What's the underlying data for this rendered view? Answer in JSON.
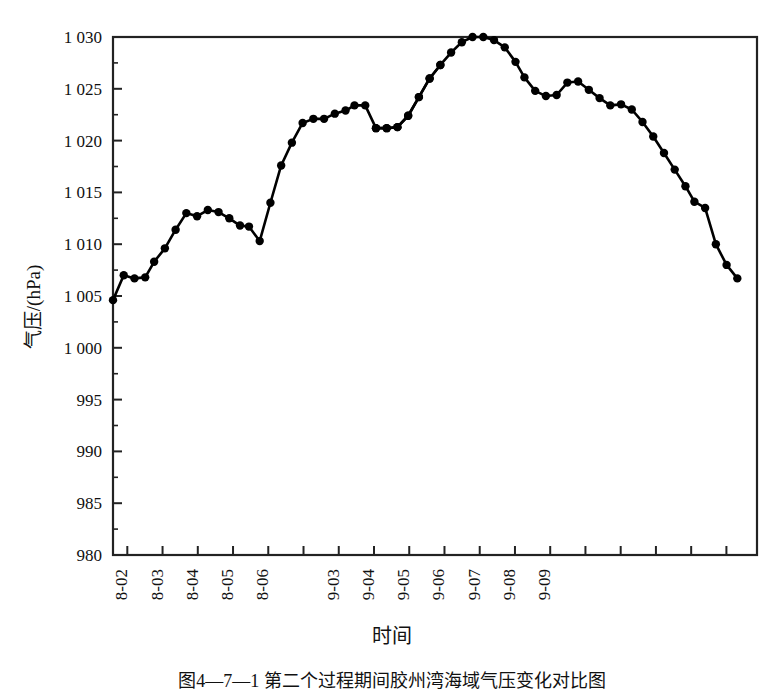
{
  "figure": {
    "y_axis_label": "气压/(hPa)",
    "x_axis_label": "时间",
    "caption": "图4—7—1 第二个过程期间胶州湾海域气压变化对比图"
  },
  "chart_data": {
    "type": "line",
    "title": "",
    "xlabel": "时间",
    "ylabel": "气压/(hPa)",
    "ylim": [
      980,
      1030
    ],
    "ytick_labels": [
      "1 030",
      "1 025",
      "1 020",
      "1 015",
      "1 010",
      "1 005",
      "1 000",
      "995",
      "990",
      "985",
      "980"
    ],
    "ytick_values": [
      1030,
      1025,
      1020,
      1015,
      1010,
      1005,
      1000,
      995,
      990,
      985,
      980
    ],
    "xtick_labels": [
      "08-02",
      "08-03",
      "08-04",
      "08-05",
      "08-06",
      "09-03",
      "09-04",
      "09-05",
      "09-06",
      "09-07",
      "09-08",
      "09-09"
    ],
    "grid": false,
    "legend": null,
    "marker": "filled-circle",
    "line_color": "#000000",
    "series": [
      {
        "name": "08 月过程",
        "x": [
          0.0,
          0.6,
          1.2,
          1.8,
          2.3,
          2.9,
          3.5,
          4.1,
          4.7,
          5.3,
          5.9,
          6.5,
          7.1,
          7.6,
          8.2,
          8.8,
          9.4,
          10.0,
          10.6,
          11.2,
          11.8,
          12.4,
          13.0,
          13.5,
          14.1,
          14.7,
          15.3,
          15.9,
          16.5,
          17.1,
          17.7,
          18.3
        ],
        "values": [
          1004.6,
          1007.0,
          1006.7,
          1006.8,
          1008.3,
          1009.6,
          1011.4,
          1013.0,
          1012.7,
          1013.3,
          1013.1,
          1012.5,
          1011.8,
          1011.7,
          1010.3,
          1014.0,
          1017.6,
          1019.8,
          1021.7,
          1022.1,
          1022.1,
          1022.6,
          1022.9,
          1023.4,
          1023.4,
          1021.2,
          1021.2,
          1021.3,
          1022.4,
          1024.2,
          1026.0,
          1027.3
        ]
      },
      {
        "name": "09 月过程",
        "x": [
          14.7,
          15.3,
          15.9,
          16.5,
          17.1,
          17.7,
          18.3,
          18.9,
          19.5,
          20.1,
          20.7,
          21.3,
          21.9,
          22.5,
          23.0,
          23.6,
          24.2,
          24.8,
          25.4,
          26.0,
          26.6,
          27.2,
          27.8,
          28.4,
          29.0,
          29.6,
          30.2,
          30.8,
          31.4,
          32.0,
          32.5,
          33.1,
          33.7,
          34.3,
          34.9
        ],
        "values": [
          1021.2,
          1021.2,
          1021.3,
          1022.4,
          1024.2,
          1026.0,
          1027.3,
          1028.5,
          1029.5,
          1030.0,
          1030.0,
          1029.7,
          1029.0,
          1027.6,
          1026.1,
          1024.8,
          1024.3,
          1024.4,
          1025.6,
          1025.7,
          1024.9,
          1024.1,
          1023.4,
          1023.5,
          1023.0,
          1021.8,
          1020.4,
          1018.8,
          1017.2,
          1015.6,
          1014.1,
          1013.5,
          1010.0,
          1008.0,
          1006.7
        ]
      }
    ]
  }
}
